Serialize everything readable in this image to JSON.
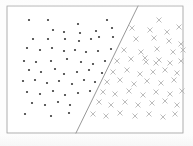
{
  "figure": {
    "name": "linearly-separable-scatter",
    "background_color": "#fdfdfd",
    "frame": {
      "x": 7,
      "y": 6,
      "width": 176,
      "height": 127,
      "stroke_color": "#9a9a9a",
      "stroke_width": 0.8
    }
  },
  "chart_data": {
    "type": "scatter",
    "title": "",
    "subtitle": "",
    "xlabel": "",
    "ylabel": "",
    "xlim": [
      0,
      176
    ],
    "ylim": [
      0,
      127
    ],
    "grid": false,
    "legend": "none",
    "annotations": [
      {
        "name": "decision-boundary",
        "type": "line",
        "label": "",
        "x1": 138,
        "y1": 6,
        "x2": 76,
        "y2": 133,
        "color": "#8c8c8c",
        "width": 0.9
      }
    ],
    "series": [
      {
        "name": "class-dot",
        "marker": "dot",
        "color": "#4a4a4a",
        "size": 2.1,
        "count": 58,
        "points": [
          [
            22,
            14
          ],
          [
            41,
            14
          ],
          [
            71,
            18
          ],
          [
            100,
            14
          ],
          [
            46,
            24
          ],
          [
            57,
            26
          ],
          [
            73,
            27
          ],
          [
            89,
            25
          ],
          [
            105,
            22
          ],
          [
            26,
            33
          ],
          [
            41,
            33
          ],
          [
            58,
            33
          ],
          [
            72,
            35
          ],
          [
            84,
            33
          ],
          [
            92,
            31
          ],
          [
            106,
            31
          ],
          [
            20,
            42
          ],
          [
            33,
            44
          ],
          [
            45,
            42
          ],
          [
            57,
            45
          ],
          [
            68,
            44
          ],
          [
            79,
            46
          ],
          [
            91,
            45
          ],
          [
            104,
            43
          ],
          [
            17,
            55
          ],
          [
            29,
            56
          ],
          [
            44,
            55
          ],
          [
            60,
            53
          ],
          [
            74,
            56
          ],
          [
            86,
            58
          ],
          [
            98,
            55
          ],
          [
            22,
            64
          ],
          [
            34,
            66
          ],
          [
            48,
            63
          ],
          [
            57,
            68
          ],
          [
            70,
            66
          ],
          [
            82,
            64
          ],
          [
            95,
            67
          ],
          [
            16,
            75
          ],
          [
            28,
            74
          ],
          [
            40,
            77
          ],
          [
            52,
            75
          ],
          [
            65,
            78
          ],
          [
            77,
            74
          ],
          [
            88,
            76
          ],
          [
            20,
            86
          ],
          [
            33,
            88
          ],
          [
            46,
            85
          ],
          [
            58,
            89
          ],
          [
            71,
            87
          ],
          [
            83,
            85
          ],
          [
            25,
            97
          ],
          [
            38,
            99
          ],
          [
            51,
            96
          ],
          [
            63,
            99
          ],
          [
            18,
            108
          ],
          [
            44,
            110
          ],
          [
            62,
            107
          ]
        ]
      },
      {
        "name": "class-cross",
        "marker": "x",
        "color": "#b0b0b0",
        "size": 4.4,
        "count": 55,
        "points": [
          [
            152,
            14
          ],
          [
            125,
            22
          ],
          [
            143,
            24
          ],
          [
            160,
            26
          ],
          [
            172,
            21
          ],
          [
            129,
            33
          ],
          [
            147,
            32
          ],
          [
            162,
            35
          ],
          [
            174,
            38
          ],
          [
            117,
            44
          ],
          [
            134,
            46
          ],
          [
            150,
            43
          ],
          [
            166,
            46
          ],
          [
            176,
            44
          ],
          [
            110,
            55
          ],
          [
            124,
            53
          ],
          [
            139,
            56
          ],
          [
            138,
            52
          ],
          [
            149,
            57
          ],
          [
            152,
            54
          ],
          [
            163,
            57
          ],
          [
            174,
            55
          ],
          [
            106,
            66
          ],
          [
            120,
            64
          ],
          [
            133,
            68
          ],
          [
            146,
            66
          ],
          [
            158,
            64
          ],
          [
            170,
            67
          ],
          [
            100,
            76
          ],
          [
            113,
            74
          ],
          [
            127,
            78
          ],
          [
            140,
            75
          ],
          [
            154,
            77
          ],
          [
            167,
            74
          ],
          [
            96,
            86
          ],
          [
            108,
            88
          ],
          [
            122,
            85
          ],
          [
            136,
            89
          ],
          [
            149,
            86
          ],
          [
            163,
            88
          ],
          [
            175,
            85
          ],
          [
            92,
            96
          ],
          [
            104,
            99
          ],
          [
            118,
            96
          ],
          [
            131,
            99
          ],
          [
            145,
            97
          ],
          [
            158,
            95
          ],
          [
            170,
            99
          ],
          [
            86,
            108
          ],
          [
            99,
            110
          ],
          [
            113,
            107
          ],
          [
            128,
            110
          ],
          [
            142,
            108
          ],
          [
            156,
            111
          ],
          [
            168,
            108
          ]
        ]
      }
    ]
  }
}
